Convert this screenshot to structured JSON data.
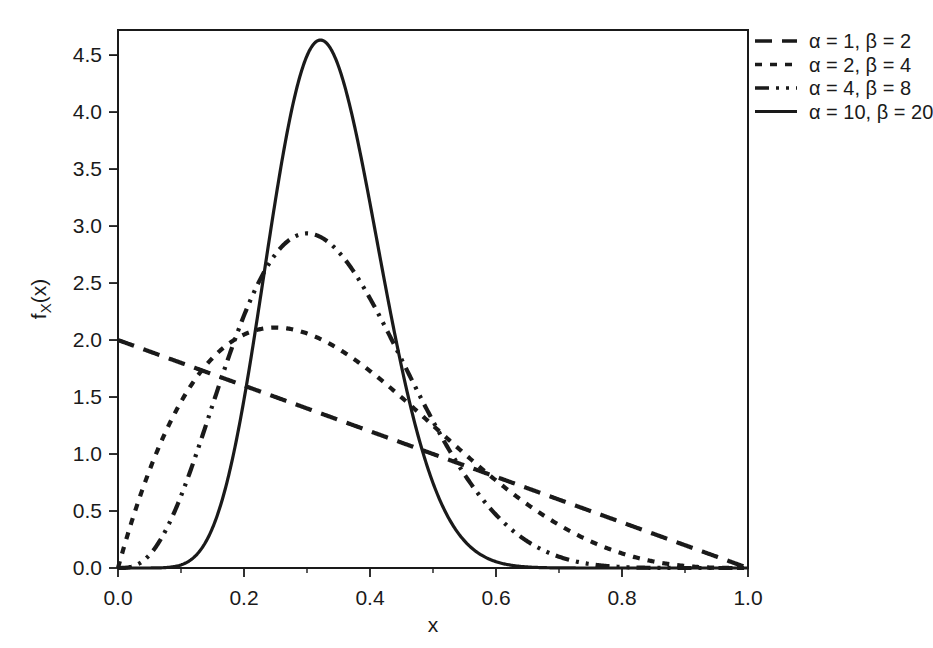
{
  "chart_data": {
    "type": "line",
    "title": "",
    "xlabel": "x",
    "ylabel": "f_X(x)",
    "ylabel_display": "f",
    "ylabel_sub": "X",
    "ylabel_tail": "(x)",
    "xlim": [
      0.0,
      1.0
    ],
    "ylim": [
      0.0,
      4.72
    ],
    "xticks": [
      "0.0",
      "0.2",
      "0.4",
      "0.6",
      "0.8",
      "1.0"
    ],
    "xtick_values": [
      0.0,
      0.2,
      0.4,
      0.6,
      0.8,
      1.0
    ],
    "xminor_step": 0.1,
    "yticks": [
      "0.0",
      "0.5",
      "1.0",
      "1.5",
      "2.0",
      "2.5",
      "3.0",
      "3.5",
      "4.0",
      "4.5"
    ],
    "ytick_values": [
      0.0,
      0.5,
      1.0,
      1.5,
      2.0,
      2.5,
      3.0,
      3.5,
      4.0,
      4.5
    ],
    "grid": false,
    "legend_position": "outside-top-right",
    "line_color": "#1a1a1a",
    "distribution": "beta",
    "series": [
      {
        "name": "α = 1,  β = 2",
        "alpha": 1,
        "beta": 2,
        "style": "longdash",
        "dasharray": "17,10",
        "width": 4.2,
        "peak_x": 0.0,
        "peak_y": 2.0,
        "x": [
          0.0,
          0.05,
          0.1,
          0.15,
          0.2,
          0.25,
          0.3,
          0.35,
          0.4,
          0.45,
          0.5,
          0.55,
          0.6,
          0.65,
          0.7,
          0.75,
          0.8,
          0.85,
          0.9,
          0.95,
          1.0
        ],
        "y": [
          2.0,
          1.9,
          1.8,
          1.7,
          1.6,
          1.5,
          1.4,
          1.3,
          1.2,
          1.1,
          1.0,
          0.9,
          0.8,
          0.7,
          0.6,
          0.5,
          0.4,
          0.3,
          0.2,
          0.1,
          0.0
        ]
      },
      {
        "name": "α = 2,  β = 4",
        "alpha": 2,
        "beta": 4,
        "style": "dotted",
        "dasharray": "7,8",
        "width": 4.2,
        "peak_x": 0.25,
        "peak_y": 2.1,
        "x": [
          0.0,
          0.05,
          0.1,
          0.15,
          0.2,
          0.25,
          0.3,
          0.35,
          0.4,
          0.45,
          0.5,
          0.55,
          0.6,
          0.65,
          0.7,
          0.75,
          0.8,
          0.85,
          0.9,
          0.95,
          1.0
        ],
        "y": [
          0.0,
          0.815,
          1.458,
          1.844,
          2.048,
          2.109,
          2.058,
          1.922,
          1.728,
          1.499,
          1.25,
          1.001,
          0.768,
          0.558,
          0.378,
          0.234,
          0.128,
          0.058,
          0.018,
          0.002,
          0.0
        ]
      },
      {
        "name": "α = 4,  β = 8",
        "alpha": 4,
        "beta": 8,
        "style": "dashdotdot",
        "dasharray": "14,7,3,7,3,7",
        "width": 4.2,
        "peak_x": 0.3,
        "peak_y": 2.9,
        "x": [
          0.0,
          0.05,
          0.1,
          0.15,
          0.2,
          0.25,
          0.3,
          0.35,
          0.4,
          0.45,
          0.5,
          0.55,
          0.6,
          0.65,
          0.7,
          0.75,
          0.8,
          0.85,
          0.9,
          0.95,
          1.0
        ],
        "y": [
          0.0,
          0.133,
          0.758,
          1.702,
          2.458,
          2.834,
          2.886,
          2.662,
          2.262,
          1.789,
          1.318,
          0.894,
          0.548,
          0.292,
          0.127,
          0.04,
          0.008,
          0.001,
          0.0,
          0.0,
          0.0
        ]
      },
      {
        "name": "α = 10, β = 20",
        "alpha": 10,
        "beta": 20,
        "style": "solid",
        "dasharray": "",
        "width": 3.2,
        "peak_x": 0.32,
        "peak_y": 4.4,
        "x": [
          0.0,
          0.05,
          0.1,
          0.15,
          0.2,
          0.25,
          0.3,
          0.35,
          0.4,
          0.45,
          0.5,
          0.55,
          0.6,
          0.65,
          0.7,
          0.75,
          0.8,
          0.85,
          0.9,
          0.95,
          1.0
        ],
        "y": [
          0.0,
          0.0,
          0.012,
          0.332,
          1.69,
          3.503,
          4.356,
          3.964,
          2.718,
          1.444,
          0.593,
          0.182,
          0.039,
          0.005,
          0.0,
          0.0,
          0.0,
          0.0,
          0.0,
          0.0,
          0.0
        ]
      }
    ]
  },
  "legend": {
    "entries": [
      {
        "label": "α = 1,  β = 2"
      },
      {
        "label": "α = 2,  β = 4"
      },
      {
        "label": "α = 4,  β = 8"
      },
      {
        "label": "α = 10, β = 20"
      }
    ]
  }
}
